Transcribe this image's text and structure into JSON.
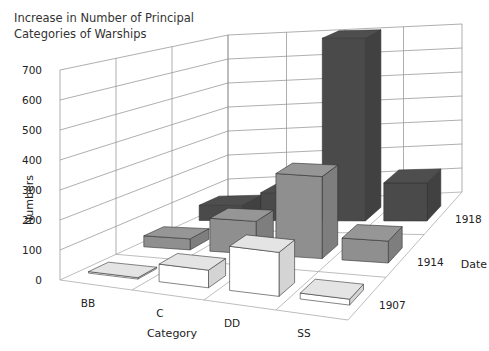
{
  "chart_data": {
    "type": "bar",
    "subtype": "3d-grouped",
    "title": "Increase in Number of Principal Categories of Warships",
    "title_lines": [
      "Increase in Number of Principal",
      "Categories of Warships"
    ],
    "xlabel": "Category",
    "ylabel": "Numbers",
    "zlabel": "Date",
    "categories": [
      "BB",
      "C",
      "DD",
      "SS"
    ],
    "dates": [
      "1907",
      "1914",
      "1918"
    ],
    "series": [
      {
        "name": "1907",
        "color": "#e4e4e4",
        "values": [
          5,
          60,
          150,
          20
        ]
      },
      {
        "name": "1914",
        "color": "#8f8f8f",
        "values": [
          40,
          120,
          300,
          80
        ]
      },
      {
        "name": "1918",
        "color": "#4a4a4a",
        "values": [
          60,
          110,
          720,
          150
        ]
      }
    ],
    "yticks": [
      0,
      100,
      200,
      300,
      400,
      500,
      600,
      700
    ],
    "ylim": [
      0,
      700
    ],
    "grid": true,
    "legend": "none"
  }
}
